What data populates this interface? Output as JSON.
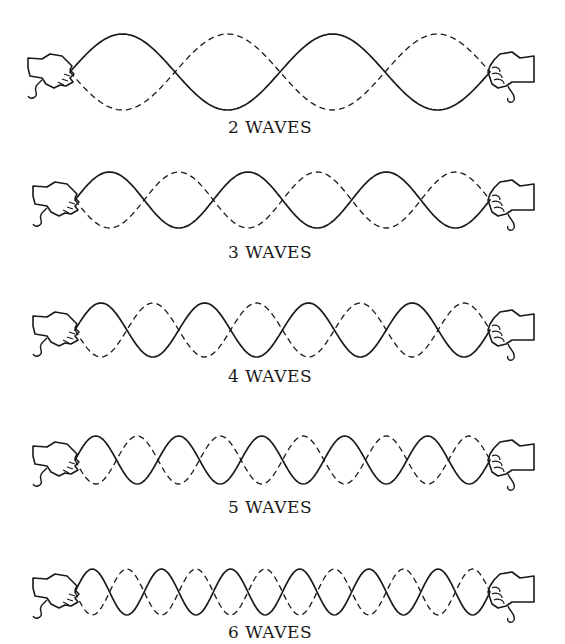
{
  "diagram": {
    "type": "standing-waves-on-rope",
    "stroke_color": "#1a1a1a",
    "background": "#ffffff",
    "rows": [
      {
        "label": "2 WAVES",
        "waves": 2,
        "half_loops": 4,
        "center_y": 72,
        "amplitude": 38,
        "x_start": 70,
        "x_end": 490,
        "label_y": 117
      },
      {
        "label": "3 WAVES",
        "waves": 3,
        "half_loops": 6,
        "center_y": 200,
        "amplitude": 28,
        "x_start": 75,
        "x_end": 490,
        "label_y": 242
      },
      {
        "label": "4 WAVES",
        "waves": 4,
        "half_loops": 8,
        "center_y": 330,
        "amplitude": 27,
        "x_start": 75,
        "x_end": 490,
        "label_y": 366
      },
      {
        "label": "5 WAVES",
        "waves": 5,
        "half_loops": 10,
        "center_y": 460,
        "amplitude": 24,
        "x_start": 75,
        "x_end": 490,
        "label_y": 497
      },
      {
        "label": "6 WAVES",
        "waves": 6,
        "half_loops": 12,
        "center_y": 592,
        "amplitude": 23,
        "x_start": 75,
        "x_end": 490,
        "label_y": 622
      }
    ],
    "legend": {
      "solid": "rope position (one extreme)",
      "dashed": "rope position (opposite extreme)"
    },
    "icons": {
      "left": "left-hand-icon",
      "right": "right-hand-icon"
    }
  }
}
